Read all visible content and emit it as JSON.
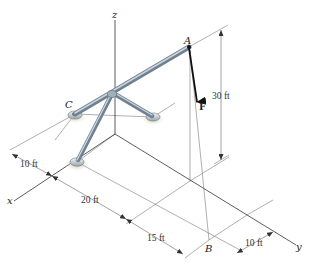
{
  "figure": {
    "axes": {
      "x": "x",
      "y": "y",
      "z": "z"
    },
    "points": {
      "A": "A",
      "B": "B",
      "C": "C"
    },
    "force": {
      "label": "F"
    },
    "dimensions": {
      "height_A": "30 ft",
      "x_offset_front": "10 ft",
      "x_span": "20 ft",
      "y_span": "15 ft",
      "y_offset_B": "10 ft"
    },
    "colors": {
      "rod": "#7d8e9c",
      "rod_highlight": "#c8d3dc",
      "force_arrow": "#111111",
      "lines": "#7a7a7a"
    }
  }
}
